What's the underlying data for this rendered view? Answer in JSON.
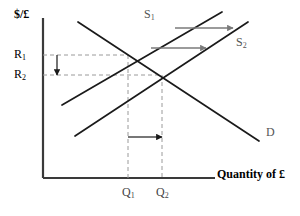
{
  "figure": {
    "type": "economics-supply-demand-diagram",
    "background": "#ffffff",
    "axis_color": "#3a3a3a",
    "curve_color": "#1a1a1a",
    "dash_color": "#9a9a9a",
    "shift_arrow_color": "#7a7a7a"
  },
  "axes": {
    "y_label": "$/£",
    "x_label": "Quantity of  £",
    "origin": {
      "x": 43,
      "y": 178
    },
    "y_top": 18,
    "x_right": 215
  },
  "price_ticks": [
    {
      "name": "R1",
      "base": "R",
      "sub": "1",
      "value_y": 55,
      "label_x": 14,
      "label_y": 48
    },
    {
      "name": "R2",
      "base": "R",
      "sub": "2",
      "value_y": 75,
      "label_x": 14,
      "label_y": 68
    }
  ],
  "quantity_ticks": [
    {
      "name": "Q1",
      "base": "Q",
      "sub": "1",
      "value_x": 128,
      "label_x": 122,
      "label_y": 186
    },
    {
      "name": "Q2",
      "base": "Q",
      "sub": "2",
      "value_x": 162,
      "label_x": 156,
      "label_y": 186
    }
  ],
  "curves": [
    {
      "id": "supply1",
      "base": "S",
      "sub": "1",
      "label_x": 144,
      "label_y": 8,
      "from": {
        "x": 62,
        "y": 105
      },
      "to": {
        "x": 222,
        "y": 12
      }
    },
    {
      "id": "supply2",
      "base": "S",
      "sub": "2",
      "label_x": 236,
      "label_y": 36,
      "from": {
        "x": 75,
        "y": 136
      },
      "to": {
        "x": 248,
        "y": 22
      }
    },
    {
      "id": "demand",
      "base": "D",
      "sub": "",
      "label_x": 266,
      "label_y": 126,
      "from": {
        "x": 78,
        "y": 22
      },
      "to": {
        "x": 259,
        "y": 141
      }
    }
  ],
  "equilibria": [
    {
      "id": "E1",
      "x": 128,
      "y": 55
    },
    {
      "id": "E2",
      "x": 162,
      "y": 75
    }
  ],
  "shift_arrows": [
    {
      "id": "supply-shift-upper",
      "x1": 175,
      "y1": 28,
      "x2": 233,
      "y2": 28
    },
    {
      "id": "supply-shift-lower",
      "x1": 151,
      "y1": 48,
      "x2": 206,
      "y2": 48
    },
    {
      "id": "quantity-shift",
      "x1": 128,
      "y1": 137,
      "x2": 162,
      "y2": 137
    },
    {
      "id": "rate-drop",
      "x1": 57,
      "y1": 55,
      "x2": 57,
      "y2": 75
    }
  ],
  "dashed_guides": [
    {
      "id": "r1-guide",
      "x1": 43,
      "y1": 55,
      "x2": 128,
      "y2": 55
    },
    {
      "id": "r2-guide",
      "x1": 43,
      "y1": 75,
      "x2": 162,
      "y2": 75
    },
    {
      "id": "q1-guide",
      "x1": 128,
      "y1": 55,
      "x2": 128,
      "y2": 178
    },
    {
      "id": "q2-guide",
      "x1": 162,
      "y1": 75,
      "x2": 162,
      "y2": 178
    }
  ]
}
